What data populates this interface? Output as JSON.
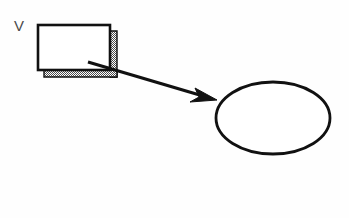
{
  "figure": {
    "background_color": "#fefefe",
    "stroke_color": "#111111",
    "shadow_color": "#6f6f6f",
    "fill_color": "#ffffff",
    "text_color": "#343434"
  },
  "source_box": {
    "label": "V",
    "shape": "rectangle",
    "x": 38,
    "y": 25,
    "width": 72,
    "height": 45,
    "shadow_offset": 6
  },
  "connector": {
    "type": "arrow",
    "from_x": 88,
    "from_y": 62,
    "to_x": 216,
    "to_y": 100,
    "stroke_width": 3
  },
  "target_object": {
    "shape": "ellipse",
    "center_x": 273,
    "center_y": 118,
    "radius_x": 57,
    "radius_y": 36,
    "shadow_offset": 7,
    "caption_line_1": "Vector",
    "caption_line_2": "object"
  }
}
